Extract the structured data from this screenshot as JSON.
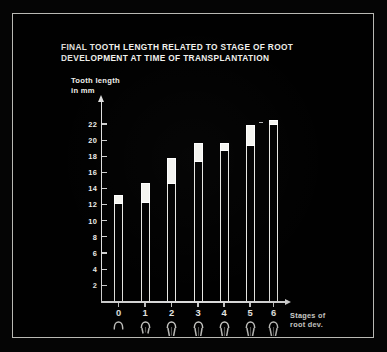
{
  "chart_data": {
    "type": "bar",
    "title": "FINAL TOOTH LENGTH RELATED TO STAGE OF ROOT DEVELOPMENT AT TIME OF TRANSPLANTATION",
    "title_lines": [
      "FINAL TOOTH LENGTH RELATED TO STAGE OF ROOT",
      "DEVELOPMENT AT TIME OF TRANSPLANTATION"
    ],
    "ylabel_lines": [
      "Tooth length",
      "in mm"
    ],
    "ylabel": "Tooth length in mm",
    "xlabel_lines": [
      "Stages of",
      "root dev."
    ],
    "xlabel": "Stages of root dev.",
    "categories": [
      "0",
      "1",
      "2",
      "3",
      "4",
      "5",
      "6"
    ],
    "ylim": [
      0,
      23.5
    ],
    "yticks": [
      2,
      4,
      6,
      8,
      10,
      12,
      14,
      16,
      18,
      20,
      22
    ],
    "ytick_labels": [
      "2",
      "4",
      "6",
      "8",
      "10",
      "12",
      "14",
      "16",
      "18",
      "20",
      "22"
    ],
    "grid": false,
    "legend": "none",
    "bar_style": "hollow outline with solid cap segment",
    "series": [
      {
        "name": "bar body top (mm)",
        "values": [
          12.1,
          12.2,
          14.5,
          17.3,
          18.6,
          19.3,
          21.9
        ]
      },
      {
        "name": "cap top (mm)",
        "values": [
          13.2,
          14.7,
          17.8,
          19.6,
          19.6,
          21.9,
          22.5
        ]
      }
    ],
    "values": [
      13.2,
      14.7,
      17.8,
      19.6,
      19.6,
      21.9,
      22.5
    ],
    "annotations": [
      "tooth pictograms below each stage label showing progressive root development",
      "small dash marker left of bar 6 top"
    ]
  },
  "icons": {
    "y_axis_arrow": "arrow-up-icon",
    "x_axis_arrow": "arrow-right-icon",
    "tooth_stage_0": "tooth-stage-0-icon",
    "tooth_stage_1": "tooth-stage-1-icon",
    "tooth_stage_2": "tooth-stage-2-icon",
    "tooth_stage_3": "tooth-stage-3-icon",
    "tooth_stage_4": "tooth-stage-4-icon",
    "tooth_stage_5": "tooth-stage-5-icon",
    "tooth_stage_6": "tooth-stage-6-icon"
  },
  "colors": {
    "background": "#010101",
    "ink": "#f2f2ee",
    "axis": "#dedede",
    "bar_outline": "#e8e8e4",
    "bar_cap": "#f4f4f0",
    "frame": "#b9b9b4"
  }
}
